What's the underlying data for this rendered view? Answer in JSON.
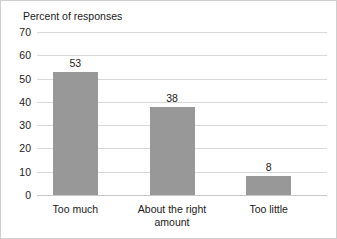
{
  "chart_data": {
    "type": "bar",
    "title": "Percent of responses",
    "xlabel": "",
    "ylabel": "",
    "categories": [
      "Too much",
      "About the right amount",
      "Too little"
    ],
    "values": [
      53,
      38,
      8
    ],
    "value_labels": [
      "53",
      "38",
      "8"
    ],
    "ylim": [
      0,
      70
    ],
    "ytick_step": 10,
    "yticks": [
      70,
      60,
      50,
      40,
      30,
      20,
      10,
      0
    ],
    "ytick_labels": [
      "70",
      "60",
      "50",
      "40",
      "30",
      "20",
      "10",
      "0"
    ],
    "grid": true,
    "grid_axis": "y",
    "legend": false,
    "legend_position": "none",
    "bar_color": "#989898",
    "grid_color": "#d8d8d8",
    "axis_color": "#c6c6c6",
    "text_color": "#1a1a1a",
    "background_color": "#ffffff"
  }
}
